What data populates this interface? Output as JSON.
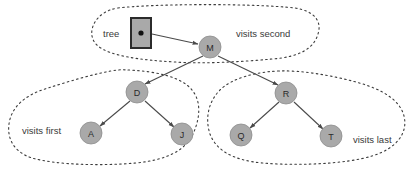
{
  "figure": {
    "background_color": "#ffffff",
    "node_fill": "#a9a9a9",
    "node_stroke": "#8d8d8d",
    "edge_color": "#4a4a4a",
    "dash_color": "#3c3c3c",
    "text_color": "#3a3a3a",
    "pointer_box_fill": "#a9a9a9",
    "pointer_box_stroke": "#2b2b2b",
    "pointer_dot_color": "#111111"
  },
  "pointer": {
    "label": "tree",
    "box_name": "tree-pointer-box",
    "dot_name": "pointer-dot"
  },
  "nodes": [
    {
      "id": "M",
      "label": "M",
      "cx": 210,
      "cy": 47,
      "r": 11
    },
    {
      "id": "D",
      "label": "D",
      "cx": 137,
      "cy": 92,
      "r": 11
    },
    {
      "id": "R",
      "label": "R",
      "cx": 286,
      "cy": 93,
      "r": 11
    },
    {
      "id": "A",
      "label": "A",
      "cx": 91,
      "cy": 133,
      "r": 11
    },
    {
      "id": "J",
      "label": "J",
      "cx": 182,
      "cy": 134,
      "r": 11
    },
    {
      "id": "Q",
      "label": "Q",
      "cx": 241,
      "cy": 135,
      "r": 11
    },
    {
      "id": "T",
      "label": "T",
      "cx": 331,
      "cy": 136,
      "r": 11
    }
  ],
  "edges": [
    {
      "from": "tree",
      "to": "M"
    },
    {
      "from": "M",
      "to": "D"
    },
    {
      "from": "M",
      "to": "R"
    },
    {
      "from": "D",
      "to": "A"
    },
    {
      "from": "D",
      "to": "J"
    },
    {
      "from": "R",
      "to": "Q"
    },
    {
      "from": "R",
      "to": "T"
    }
  ],
  "regions": [
    {
      "id": "second",
      "label": "visits second",
      "label_x": 236,
      "label_y": 33
    },
    {
      "id": "first",
      "label": "visits first",
      "label_x": 22,
      "label_y": 130
    },
    {
      "id": "last",
      "label": "visits last",
      "label_x": 353,
      "label_y": 139
    }
  ]
}
